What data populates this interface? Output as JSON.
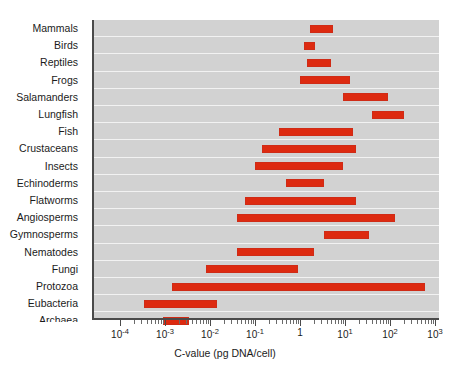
{
  "chart_data": {
    "type": "bar",
    "orientation": "horizontal",
    "title": "",
    "xlabel": "C-value (pg DNA/cell)",
    "ylabel": "",
    "xscale": "log",
    "xlim": [
      0.0001,
      1000
    ],
    "grid": "horizontal-row-separators",
    "legend": "none",
    "bar_color": "#dd2a10",
    "plot_background": "#d2d2d2",
    "categories": [
      "Mammals",
      "Birds",
      "Reptiles",
      "Frogs",
      "Salamanders",
      "Lungfish",
      "Fish",
      "Crustaceans",
      "Insects",
      "Echinoderms",
      "Flatworms",
      "Angiosperms",
      "Gymnosperms",
      "Nematodes",
      "Fungi",
      "Protozoa",
      "Eubacteria",
      "Archaea"
    ],
    "ranges": [
      {
        "category": "Mammals",
        "min": 1.7,
        "max": 5.5
      },
      {
        "category": "Birds",
        "min": 1.2,
        "max": 2.2
      },
      {
        "category": "Reptiles",
        "min": 1.4,
        "max": 5.0
      },
      {
        "category": "Frogs",
        "min": 1.0,
        "max": 13.0
      },
      {
        "category": "Salamanders",
        "min": 9.0,
        "max": 90.0
      },
      {
        "category": "Lungfish",
        "min": 40.0,
        "max": 200.0
      },
      {
        "category": "Fish",
        "min": 0.35,
        "max": 15.0
      },
      {
        "category": "Crustaceans",
        "min": 0.14,
        "max": 18.0
      },
      {
        "category": "Insects",
        "min": 0.1,
        "max": 9.0
      },
      {
        "category": "Echinoderms",
        "min": 0.5,
        "max": 3.5
      },
      {
        "category": "Flatworms",
        "min": 0.06,
        "max": 18.0
      },
      {
        "category": "Angiosperms",
        "min": 0.04,
        "max": 130.0
      },
      {
        "category": "Gymnosperms",
        "min": 3.5,
        "max": 35.0
      },
      {
        "category": "Nematodes",
        "min": 0.04,
        "max": 2.0
      },
      {
        "category": "Fungi",
        "min": 0.008,
        "max": 0.9
      },
      {
        "category": "Protozoa",
        "min": 0.0014,
        "max": 600.0
      },
      {
        "category": "Eubacteria",
        "min": 0.00035,
        "max": 0.014
      },
      {
        "category": "Archaea",
        "min": 0.0009,
        "max": 0.0035
      }
    ],
    "x_ticks": [
      {
        "value": 0.0001,
        "label": "10",
        "exponent": "-4"
      },
      {
        "value": 0.001,
        "label": "10",
        "exponent": "-3"
      },
      {
        "value": 0.01,
        "label": "10",
        "exponent": "-2"
      },
      {
        "value": 0.1,
        "label": "10",
        "exponent": "-1"
      },
      {
        "value": 1,
        "label": "1",
        "exponent": ""
      },
      {
        "value": 10,
        "label": "10",
        "exponent": "1"
      },
      {
        "value": 100,
        "label": "10",
        "exponent": "2"
      },
      {
        "value": 1000,
        "label": "10",
        "exponent": "3"
      }
    ]
  }
}
